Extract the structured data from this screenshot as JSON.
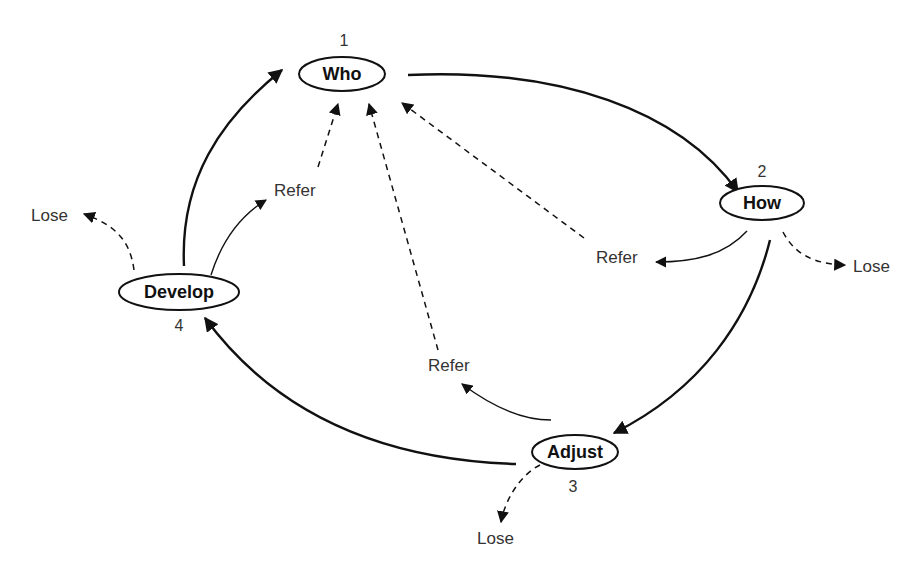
{
  "diagram": {
    "nodes": [
      {
        "id": "who",
        "label": "Who",
        "number": "1"
      },
      {
        "id": "how",
        "label": "How",
        "number": "2"
      },
      {
        "id": "adjust",
        "label": "Adjust",
        "number": "3"
      },
      {
        "id": "develop",
        "label": "Develop",
        "number": "4"
      }
    ],
    "outcomes": {
      "refer_develop": "Refer",
      "refer_how": "Refer",
      "refer_adjust": "Refer",
      "lose_develop": "Lose",
      "lose_how": "Lose",
      "lose_adjust": "Lose"
    },
    "edges": [
      {
        "from": "who",
        "to": "how",
        "style": "solid-bold"
      },
      {
        "from": "how",
        "to": "adjust",
        "style": "solid-bold"
      },
      {
        "from": "adjust",
        "to": "develop",
        "style": "solid-bold"
      },
      {
        "from": "develop",
        "to": "who",
        "style": "solid-bold"
      },
      {
        "from": "develop",
        "to": "refer_develop",
        "style": "solid-thin"
      },
      {
        "from": "how",
        "to": "refer_how",
        "style": "solid-thin"
      },
      {
        "from": "adjust",
        "to": "refer_adjust",
        "style": "solid-thin"
      },
      {
        "from": "refer_develop",
        "to": "who",
        "style": "dashed"
      },
      {
        "from": "refer_how",
        "to": "who",
        "style": "dashed"
      },
      {
        "from": "refer_adjust",
        "to": "who",
        "style": "dashed"
      },
      {
        "from": "develop",
        "to": "lose_develop",
        "style": "dashed"
      },
      {
        "from": "how",
        "to": "lose_how",
        "style": "dashed"
      },
      {
        "from": "adjust",
        "to": "lose_adjust",
        "style": "dashed"
      }
    ]
  }
}
